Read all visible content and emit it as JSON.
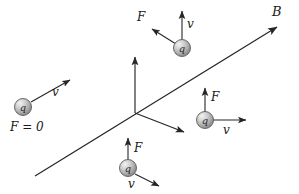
{
  "figure": {
    "background_color": "#ffffff",
    "line_color": "#262626",
    "particle_fill": "#b3b3b3",
    "particle_stroke": "#555555"
  },
  "field": {
    "label": "B",
    "start": {
      "x": 35,
      "y": 176
    },
    "end": {
      "x": 277,
      "y": 27
    }
  },
  "axes": {
    "origin": {
      "x": 135,
      "y": 113
    },
    "vertical_tip": {
      "x": 135,
      "y": 55
    },
    "diagonal_tip": {
      "x": 186,
      "y": 133
    }
  },
  "particles": [
    {
      "id": "particle-left",
      "charge_label": "q",
      "center": {
        "x": 23,
        "y": 107
      },
      "velocity": {
        "label": "v",
        "tip": {
          "x": 72,
          "y": 79
        },
        "label_pos": {
          "x": 52,
          "y": 93
        }
      },
      "force": null,
      "force_text": "F = 0",
      "force_text_pos": {
        "x": 10,
        "y": 120
      }
    },
    {
      "id": "particle-top",
      "charge_label": "q",
      "center": {
        "x": 182,
        "y": 48
      },
      "velocity": {
        "label": "v",
        "tip": {
          "x": 182,
          "y": 9
        },
        "label_pos": {
          "x": 187,
          "y": 24
        }
      },
      "force": {
        "label": "F",
        "tip": {
          "x": 150,
          "y": 28
        },
        "label_pos": {
          "x": 140,
          "y": 17
        }
      },
      "force_text": null
    },
    {
      "id": "particle-right",
      "charge_label": "q",
      "center": {
        "x": 205,
        "y": 120
      },
      "velocity": {
        "label": "v",
        "tip": {
          "x": 248,
          "y": 120
        },
        "label_pos": {
          "x": 223,
          "y": 132
        }
      },
      "force": {
        "label": "F",
        "tip": {
          "x": 205,
          "y": 86
        },
        "label_pos": {
          "x": 211,
          "y": 97
        }
      },
      "force_text": null
    },
    {
      "id": "particle-bottom",
      "charge_label": "q",
      "center": {
        "x": 128,
        "y": 168
      },
      "velocity": {
        "label": "v",
        "tip": {
          "x": 161,
          "y": 187
        },
        "label_pos": {
          "x": 131,
          "y": 184
        }
      },
      "force": {
        "label": "F",
        "tip": {
          "x": 128,
          "y": 136
        },
        "label_pos": {
          "x": 134,
          "y": 148
        }
      },
      "force_text": null
    }
  ]
}
